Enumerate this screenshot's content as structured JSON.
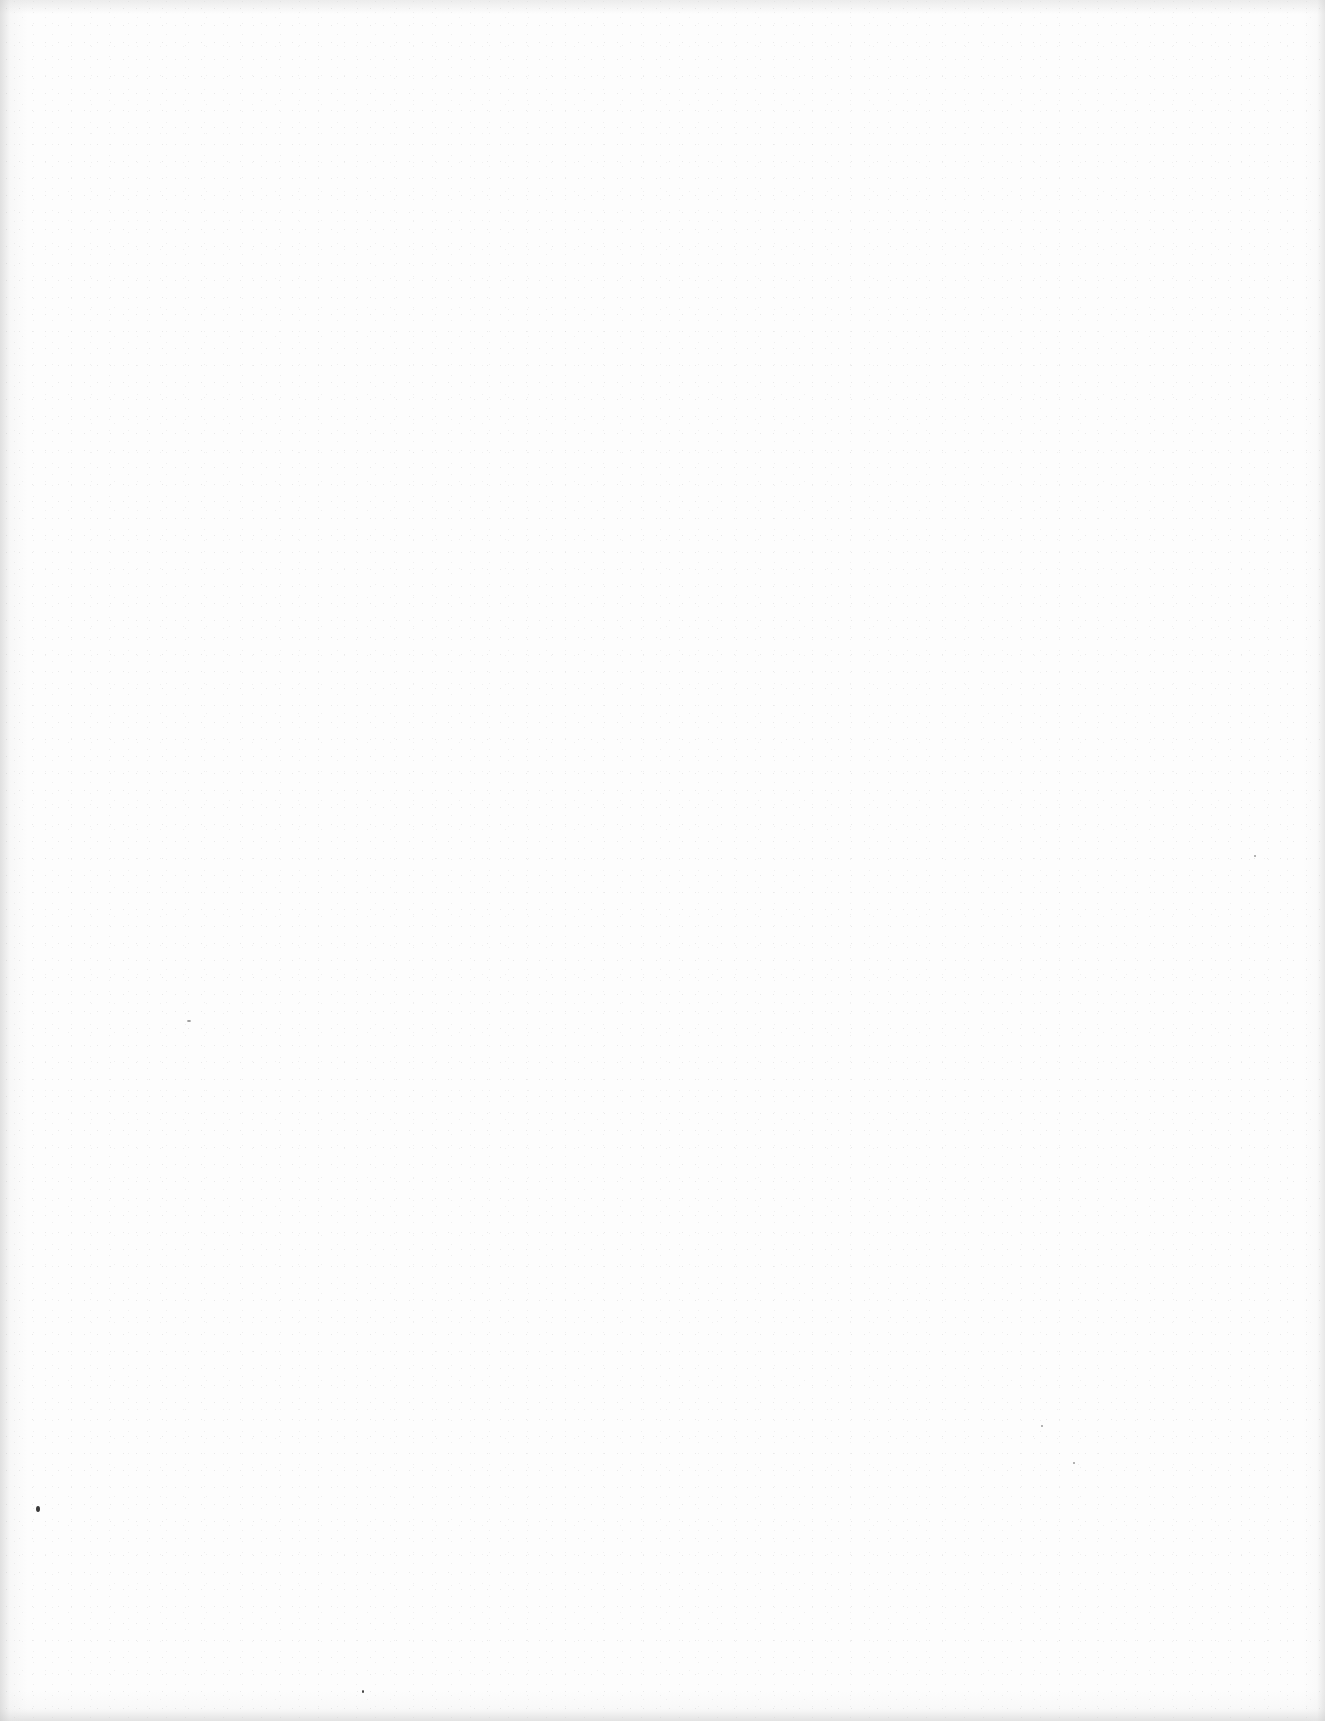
{
  "document": {
    "type": "scanned-page",
    "content": "",
    "background_color": "#fdfdfd",
    "marks": [
      {
        "name": "dust-speck",
        "x": 36,
        "y": 1506,
        "w": 4,
        "h": 6,
        "tone": "dark"
      },
      {
        "name": "dust-speck",
        "x": 362,
        "y": 1690,
        "w": 2,
        "h": 3,
        "tone": "dark"
      },
      {
        "name": "dust-speck",
        "x": 187,
        "y": 1020,
        "w": 4,
        "h": 2,
        "tone": "faint"
      },
      {
        "name": "dust-speck",
        "x": 1041,
        "y": 1425,
        "w": 2,
        "h": 2,
        "tone": "faint"
      },
      {
        "name": "dust-speck",
        "x": 1254,
        "y": 855,
        "w": 2,
        "h": 2,
        "tone": "faint"
      },
      {
        "name": "dust-speck",
        "x": 1073,
        "y": 1462,
        "w": 2,
        "h": 2,
        "tone": "faint"
      }
    ]
  }
}
